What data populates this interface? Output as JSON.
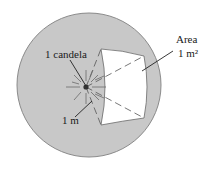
{
  "diagram": {
    "labels": {
      "source": "1 candela",
      "radius": "1 m",
      "area_line1": "Area",
      "area_line2": "1 m²"
    },
    "colors": {
      "sphere_fill": "#c8c8c8",
      "sphere_stroke": "#8a8a8a",
      "area_fill": "#ffffff",
      "line": "#3a3a3a"
    }
  }
}
